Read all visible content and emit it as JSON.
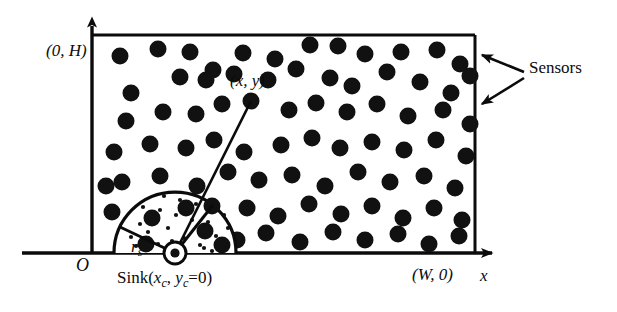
{
  "figure": {
    "type": "diagram",
    "labels": {
      "top_left_corner": "(0, H)",
      "node_xy": "(x, y)",
      "origin": "O",
      "sensing_radius": "r",
      "sensing_radius_sub": "s",
      "sink_prefix": "Sink(",
      "sink_x": "x",
      "sink_x_sub": "c",
      "sink_comma": ", ",
      "sink_y": "y",
      "sink_y_sub": "c",
      "sink_suffix": "=0)",
      "bottom_right_corner": "(W, 0)",
      "x_axis": "x",
      "sensors": "Sensors"
    },
    "colors": {
      "ink": "#0b0b0b",
      "background": "#ffffff",
      "sensor_fill": "#111111"
    },
    "geometry": {
      "field_rect": {
        "x": 92,
        "y": 35,
        "width": 383,
        "height": 218
      },
      "y_axis": {
        "x": 92,
        "y_top": 22,
        "y_bottom": 253
      },
      "x_axis": {
        "y": 253,
        "x_left": 22,
        "x_right": 497
      },
      "sink": {
        "cx": 175,
        "cy": 253,
        "outer_r": 11,
        "inner_r": 7,
        "dot_r": 4
      },
      "sensing_semicircle": {
        "cx": 175,
        "cy": 253,
        "r": 61
      },
      "radius_line_angle_deg": 205,
      "link_line": {
        "x1": 175,
        "y1": 253,
        "x2": 251,
        "y2": 101
      },
      "sensor_radius": 8.5
    },
    "sensors_field": [
      [
        120,
        56
      ],
      [
        158,
        49
      ],
      [
        190,
        52
      ],
      [
        213,
        70
      ],
      [
        243,
        53
      ],
      [
        275,
        59
      ],
      [
        310,
        45
      ],
      [
        338,
        46
      ],
      [
        365,
        54
      ],
      [
        401,
        52
      ],
      [
        437,
        50
      ],
      [
        460,
        64
      ],
      [
        131,
        93
      ],
      [
        180,
        77
      ],
      [
        206,
        80
      ],
      [
        234,
        74
      ],
      [
        268,
        80
      ],
      [
        296,
        69
      ],
      [
        330,
        78
      ],
      [
        352,
        86
      ],
      [
        387,
        72
      ],
      [
        420,
        82
      ],
      [
        451,
        93
      ],
      [
        470,
        76
      ],
      [
        126,
        121
      ],
      [
        163,
        112
      ],
      [
        196,
        114
      ],
      [
        222,
        104
      ],
      [
        251,
        101
      ],
      [
        289,
        110
      ],
      [
        316,
        103
      ],
      [
        347,
        112
      ],
      [
        377,
        104
      ],
      [
        408,
        116
      ],
      [
        443,
        110
      ],
      [
        470,
        124
      ],
      [
        114,
        152
      ],
      [
        150,
        144
      ],
      [
        186,
        148
      ],
      [
        214,
        140
      ],
      [
        244,
        152
      ],
      [
        281,
        145
      ],
      [
        312,
        138
      ],
      [
        340,
        148
      ],
      [
        372,
        142
      ],
      [
        404,
        150
      ],
      [
        436,
        140
      ],
      [
        466,
        156
      ],
      [
        122,
        182
      ],
      [
        160,
        176
      ],
      [
        197,
        186
      ],
      [
        228,
        172
      ],
      [
        259,
        180
      ],
      [
        292,
        175
      ],
      [
        325,
        186
      ],
      [
        358,
        172
      ],
      [
        390,
        182
      ],
      [
        424,
        176
      ],
      [
        455,
        188
      ],
      [
        247,
        208
      ],
      [
        278,
        216
      ],
      [
        309,
        204
      ],
      [
        341,
        214
      ],
      [
        372,
        206
      ],
      [
        403,
        218
      ],
      [
        434,
        208
      ],
      [
        462,
        220
      ],
      [
        237,
        240
      ],
      [
        266,
        233
      ],
      [
        300,
        242
      ],
      [
        333,
        232
      ],
      [
        365,
        240
      ],
      [
        398,
        234
      ],
      [
        429,
        244
      ],
      [
        459,
        236
      ],
      [
        112,
        212
      ],
      [
        106,
        186
      ]
    ],
    "sensors_in_range": [
      [
        152,
        218
      ],
      [
        186,
        208
      ],
      [
        205,
        231
      ],
      [
        212,
        206
      ],
      [
        146,
        244
      ],
      [
        222,
        245
      ]
    ],
    "speckles": [
      [
        131,
        237
      ],
      [
        140,
        224
      ],
      [
        148,
        232
      ],
      [
        160,
        210
      ],
      [
        168,
        228
      ],
      [
        176,
        215
      ],
      [
        184,
        238
      ],
      [
        192,
        220
      ],
      [
        200,
        245
      ],
      [
        208,
        222
      ],
      [
        216,
        236
      ],
      [
        224,
        215
      ],
      [
        158,
        244
      ],
      [
        172,
        241
      ],
      [
        196,
        204
      ],
      [
        204,
        248
      ],
      [
        136,
        246
      ],
      [
        212,
        251
      ],
      [
        164,
        196
      ],
      [
        180,
        200
      ],
      [
        143,
        207
      ],
      [
        228,
        228
      ]
    ],
    "sensor_arrows": [
      {
        "from": [
          524,
          72
        ],
        "to": [
          476,
          53
        ]
      },
      {
        "from": [
          524,
          78
        ],
        "to": [
          476,
          106
        ]
      }
    ]
  }
}
